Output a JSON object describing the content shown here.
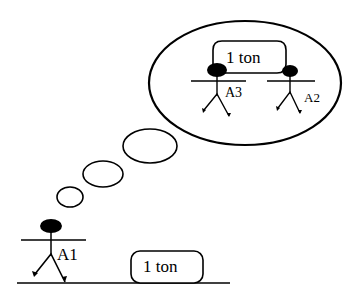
{
  "diagram": {
    "type": "thought-bubble scenario",
    "colors": {
      "stroke": "#000000",
      "background": "#ffffff"
    },
    "ground": {
      "object_label": "1 ton"
    },
    "agents": [
      {
        "id": "A1",
        "label": "A1",
        "location": "ground"
      },
      {
        "id": "A3",
        "label": "A3",
        "location": "thought"
      },
      {
        "id": "A2",
        "label": "A2",
        "location": "thought"
      }
    ],
    "thought": {
      "object_label": "1 ton",
      "carried_by": [
        "A3",
        "A2"
      ]
    }
  }
}
